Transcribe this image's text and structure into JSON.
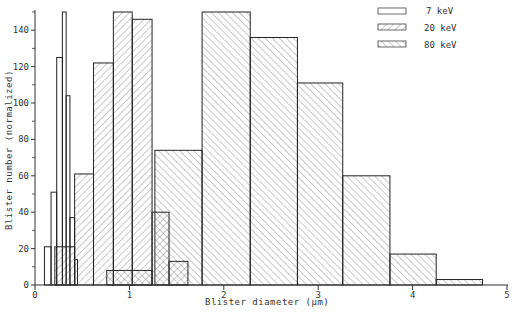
{
  "chart_data": {
    "type": "bar",
    "subtype": "histogram",
    "title": "",
    "xlabel": "Blister diameter (μm)",
    "ylabel": "Blister number (normalized)",
    "xlim": [
      0,
      5
    ],
    "ylim": [
      0,
      150
    ],
    "x_ticks": [
      "0",
      "1",
      "2",
      "3",
      "4",
      "5"
    ],
    "y_ticks": [
      "0",
      "20",
      "40",
      "60",
      "80",
      "100",
      "120",
      "140"
    ],
    "grid": false,
    "legend_position": "top-right",
    "legend": [
      "7 keV",
      "20 keV",
      "80 keV"
    ],
    "series": [
      {
        "name": "7 keV",
        "fill": "open",
        "bins": [
          {
            "x0": 0.1,
            "x1": 0.17,
            "value": 21
          },
          {
            "x0": 0.17,
            "x1": 0.23,
            "value": 51
          },
          {
            "x0": 0.23,
            "x1": 0.29,
            "value": 125
          },
          {
            "x0": 0.29,
            "x1": 0.33,
            "value": 150
          },
          {
            "x0": 0.33,
            "x1": 0.37,
            "value": 104
          },
          {
            "x0": 0.37,
            "x1": 0.42,
            "value": 37
          },
          {
            "x0": 0.42,
            "x1": 0.45,
            "value": 14
          }
        ]
      },
      {
        "name": "20 keV",
        "fill": "hatch-forward",
        "bins": [
          {
            "x0": 0.21,
            "x1": 0.42,
            "value": 21
          },
          {
            "x0": 0.42,
            "x1": 0.62,
            "value": 61
          },
          {
            "x0": 0.62,
            "x1": 0.83,
            "value": 122
          },
          {
            "x0": 0.83,
            "x1": 1.03,
            "value": 150
          },
          {
            "x0": 1.03,
            "x1": 1.24,
            "value": 146
          },
          {
            "x0": 1.24,
            "x1": 1.42,
            "value": 40
          },
          {
            "x0": 1.42,
            "x1": 1.62,
            "value": 13
          }
        ]
      },
      {
        "name": "80 keV",
        "fill": "hatch-back",
        "bins": [
          {
            "x0": 0.76,
            "x1": 1.24,
            "value": 8
          },
          {
            "x0": 1.27,
            "x1": 1.77,
            "value": 74
          },
          {
            "x0": 1.77,
            "x1": 2.28,
            "value": 150
          },
          {
            "x0": 2.28,
            "x1": 2.78,
            "value": 136
          },
          {
            "x0": 2.78,
            "x1": 3.26,
            "value": 111
          },
          {
            "x0": 3.26,
            "x1": 3.76,
            "value": 60
          },
          {
            "x0": 3.76,
            "x1": 4.25,
            "value": 17
          },
          {
            "x0": 4.25,
            "x1": 4.74,
            "value": 3
          }
        ]
      }
    ]
  },
  "labels": {
    "xlabel": "Blister  diameter  (μm)",
    "ylabel": "Blister  number   (normalized)",
    "legend_7": "7  keV",
    "legend_20": "20 keV",
    "legend_80": "80 keV"
  }
}
